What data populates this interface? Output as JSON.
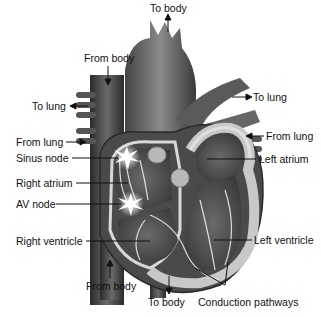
{
  "diagram": {
    "labels": {
      "to_body_top": "To body",
      "from_body_top": "From body",
      "to_lung_left": "To lung",
      "to_lung_right": "To lung",
      "from_lung_left": "From lung",
      "from_lung_right": "From lung",
      "sinus_node": "Sinus node",
      "left_atrium": "Left atrium",
      "right_atrium": "Right atrium",
      "av_node": "AV node",
      "right_ventricle": "Right ventricle",
      "left_ventricle": "Left ventricle",
      "from_body_bottom": "From body",
      "to_body_bottom": "To body",
      "conduction_pathways": "Conduction pathways"
    }
  }
}
